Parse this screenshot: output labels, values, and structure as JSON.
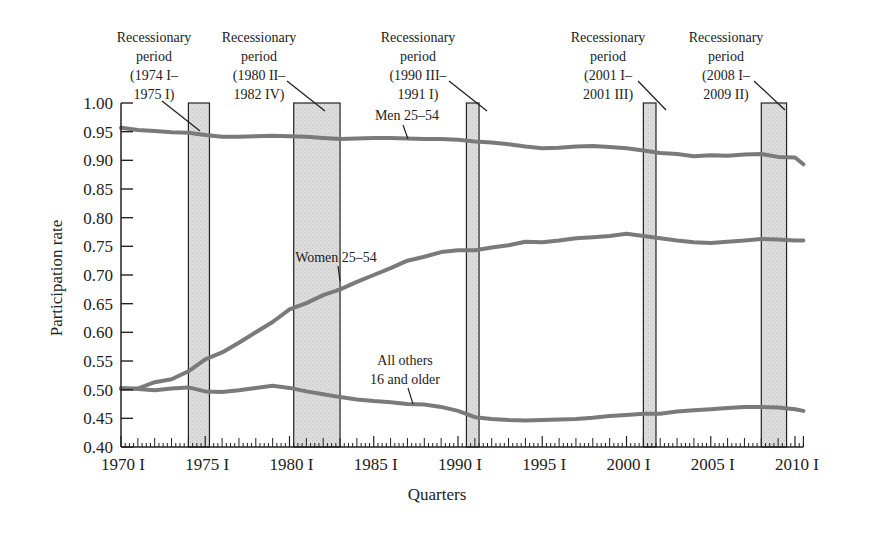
{
  "chart_data": {
    "type": "line",
    "title": "",
    "xlabel": "Quarters",
    "ylabel": "Participation rate",
    "ylim": [
      0.4,
      1.0
    ],
    "xlim": [
      1970.0,
      2010.5
    ],
    "grid": false,
    "legend": "inline labels",
    "y_ticks": [
      "0.40",
      "0.45",
      "0.50",
      "0.55",
      "0.60",
      "0.65",
      "0.70",
      "0.75",
      "0.80",
      "0.85",
      "0.90",
      "0.95",
      "1.00"
    ],
    "x_ticks": [
      "1970 I",
      "1975 I",
      "1980 I",
      "1985 I",
      "1990 I",
      "1995 I",
      "2000 I",
      "2005 I",
      "2010 I"
    ],
    "x_tick_years": [
      1970,
      1975,
      1980,
      1985,
      1990,
      1995,
      2000,
      2005,
      2010
    ],
    "recessions": [
      {
        "start": 1974.0,
        "end": 1975.25,
        "label": [
          "Recessionary",
          "period",
          "(1974 I–",
          "1975 I)"
        ]
      },
      {
        "start": 1980.25,
        "end": 1983.0,
        "label": [
          "Recessionary",
          "period",
          "(1980 II–",
          "1982 IV)"
        ]
      },
      {
        "start": 1990.5,
        "end": 1991.25,
        "label": [
          "Recessionary",
          "period",
          "(1990 III–",
          "1991 I)"
        ]
      },
      {
        "start": 2001.0,
        "end": 2001.75,
        "label": [
          "Recessionary",
          "period",
          "(2001 I–",
          "2001 III)"
        ]
      },
      {
        "start": 2008.0,
        "end": 2009.5,
        "label": [
          "Recessionary",
          "period",
          "(2008 I–",
          "2009 II)"
        ]
      }
    ],
    "series": [
      {
        "name": "Men 25–54",
        "label": "Men 25–54",
        "x": [
          1970,
          1971,
          1972,
          1973,
          1974,
          1975,
          1976,
          1977,
          1978,
          1979,
          1980,
          1981,
          1982,
          1983,
          1984,
          1985,
          1986,
          1987,
          1988,
          1989,
          1990,
          1991,
          1992,
          1993,
          1994,
          1995,
          1996,
          1997,
          1998,
          1999,
          2000,
          2001,
          2002,
          2003,
          2004,
          2005,
          2006,
          2007,
          2008,
          2009,
          2010,
          2010.5
        ],
        "values": [
          0.957,
          0.953,
          0.951,
          0.949,
          0.948,
          0.944,
          0.941,
          0.941,
          0.942,
          0.943,
          0.942,
          0.941,
          0.939,
          0.937,
          0.938,
          0.939,
          0.939,
          0.938,
          0.937,
          0.937,
          0.936,
          0.933,
          0.931,
          0.928,
          0.924,
          0.921,
          0.922,
          0.924,
          0.925,
          0.923,
          0.921,
          0.917,
          0.913,
          0.911,
          0.907,
          0.909,
          0.908,
          0.91,
          0.911,
          0.906,
          0.905,
          0.893
        ]
      },
      {
        "name": "Women 25–54",
        "label": "Women 25–54",
        "x": [
          1970,
          1971,
          1972,
          1973,
          1974,
          1975,
          1976,
          1977,
          1978,
          1979,
          1980,
          1981,
          1982,
          1983,
          1984,
          1985,
          1986,
          1987,
          1988,
          1989,
          1990,
          1991,
          1992,
          1993,
          1994,
          1995,
          1996,
          1997,
          1998,
          1999,
          2000,
          2001,
          2002,
          2003,
          2004,
          2005,
          2006,
          2007,
          2008,
          2009,
          2010,
          2010.5
        ],
        "values": [
          0.501,
          0.502,
          0.513,
          0.518,
          0.532,
          0.553,
          0.565,
          0.582,
          0.6,
          0.618,
          0.64,
          0.651,
          0.665,
          0.675,
          0.688,
          0.7,
          0.712,
          0.725,
          0.732,
          0.74,
          0.743,
          0.743,
          0.748,
          0.752,
          0.758,
          0.757,
          0.76,
          0.764,
          0.766,
          0.768,
          0.772,
          0.768,
          0.764,
          0.76,
          0.757,
          0.756,
          0.758,
          0.76,
          0.763,
          0.762,
          0.76,
          0.76
        ]
      },
      {
        "name": "All others 16 and older",
        "label": [
          "All others",
          "16 and older"
        ],
        "x": [
          1970,
          1971,
          1972,
          1973,
          1974,
          1975,
          1976,
          1977,
          1978,
          1979,
          1980,
          1981,
          1982,
          1983,
          1984,
          1985,
          1986,
          1987,
          1988,
          1989,
          1990,
          1991,
          1992,
          1993,
          1994,
          1995,
          1996,
          1997,
          1998,
          1999,
          2000,
          2001,
          2002,
          2003,
          2004,
          2005,
          2006,
          2007,
          2008,
          2009,
          2010,
          2010.5
        ],
        "values": [
          0.503,
          0.501,
          0.499,
          0.502,
          0.504,
          0.497,
          0.496,
          0.499,
          0.503,
          0.507,
          0.503,
          0.497,
          0.492,
          0.487,
          0.483,
          0.48,
          0.478,
          0.475,
          0.474,
          0.47,
          0.463,
          0.452,
          0.449,
          0.447,
          0.446,
          0.447,
          0.448,
          0.449,
          0.451,
          0.454,
          0.456,
          0.458,
          0.458,
          0.462,
          0.464,
          0.466,
          0.468,
          0.47,
          0.47,
          0.469,
          0.466,
          0.463
        ]
      }
    ],
    "colors": {
      "line": "#7a7a7a",
      "recession_fill": "#d9d9d9",
      "axis": "#222222",
      "text": "#222222"
    }
  }
}
